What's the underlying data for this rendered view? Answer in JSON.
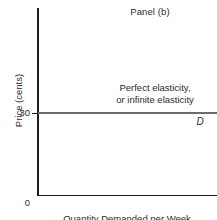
{
  "panel": {
    "title": "Panel (b)"
  },
  "axes": {
    "y_title": "Price (cents)",
    "x_title": "Quantity Demanded per Week",
    "origin_label": "0",
    "y_tick_label": "30"
  },
  "annotation": {
    "line1": "Perfect elasticity,",
    "line2": "or infinite elasticity"
  },
  "curve": {
    "label": "D"
  },
  "colors": {
    "axis": "#1d1d1d",
    "curve": "#6b6b6b",
    "text": "#2b2b2b",
    "background": "#ffffff"
  },
  "chart_data": {
    "type": "line",
    "title": "Panel (b)",
    "xlabel": "Quantity Demanded per Week",
    "ylabel": "Price (cents)",
    "series": [
      {
        "name": "D",
        "x": [
          0,
          100
        ],
        "values": [
          30,
          30
        ]
      }
    ],
    "ylim": [
      0,
      50
    ],
    "xlim": [
      0,
      100
    ],
    "yticks": [
      0,
      30
    ],
    "ytick_labels": [
      "0",
      "30"
    ],
    "xticks": [],
    "xtick_labels": [],
    "grid": false,
    "legend": false,
    "annotations": [
      {
        "text": "Perfect elasticity, or infinite elasticity",
        "x": 62,
        "y": 36
      },
      {
        "text": "D",
        "x": 94,
        "y": 26
      }
    ]
  }
}
